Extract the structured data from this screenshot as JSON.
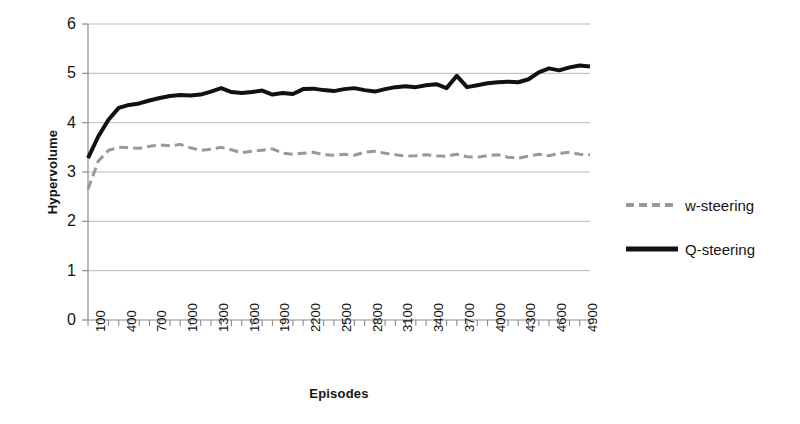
{
  "chart_data": {
    "type": "line",
    "title": "",
    "xlabel": "Episodes",
    "ylabel": "Hypervolume",
    "xlim": [
      100,
      5000
    ],
    "ylim": [
      0,
      6
    ],
    "grid": true,
    "legend_position": "right",
    "y_ticks": [
      0,
      1,
      2,
      3,
      4,
      5,
      6
    ],
    "x_tick_labels": [
      "100",
      "400",
      "700",
      "1000",
      "1300",
      "1600",
      "1900",
      "2200",
      "2500",
      "2800",
      "3100",
      "3400",
      "3700",
      "4000",
      "4300",
      "4600",
      "4900"
    ],
    "x_tick_values": [
      100,
      400,
      700,
      1000,
      1300,
      1600,
      1900,
      2200,
      2500,
      2800,
      3100,
      3400,
      3700,
      4000,
      4300,
      4600,
      4900
    ],
    "x_minor_step": 100,
    "x": [
      100,
      200,
      300,
      400,
      500,
      600,
      700,
      800,
      900,
      1000,
      1100,
      1200,
      1300,
      1400,
      1500,
      1600,
      1700,
      1800,
      1900,
      2000,
      2100,
      2200,
      2300,
      2400,
      2500,
      2600,
      2700,
      2800,
      2900,
      3000,
      3100,
      3200,
      3300,
      3400,
      3500,
      3600,
      3700,
      3800,
      3900,
      4000,
      4100,
      4200,
      4300,
      4400,
      4500,
      4600,
      4700,
      4800,
      4900,
      5000
    ],
    "series": [
      {
        "name": "w-steering",
        "color": "#999999",
        "style": "dashed",
        "width": 3,
        "values": [
          2.65,
          3.22,
          3.44,
          3.5,
          3.49,
          3.48,
          3.52,
          3.55,
          3.53,
          3.56,
          3.49,
          3.44,
          3.46,
          3.5,
          3.45,
          3.39,
          3.42,
          3.44,
          3.47,
          3.38,
          3.36,
          3.38,
          3.4,
          3.35,
          3.34,
          3.36,
          3.34,
          3.4,
          3.42,
          3.38,
          3.35,
          3.32,
          3.33,
          3.35,
          3.33,
          3.32,
          3.36,
          3.31,
          3.3,
          3.33,
          3.35,
          3.3,
          3.28,
          3.32,
          3.36,
          3.33,
          3.38,
          3.4,
          3.36,
          3.35
        ]
      },
      {
        "name": "Q-steering",
        "color": "#111111",
        "style": "solid",
        "width": 4,
        "values": [
          3.28,
          3.72,
          4.06,
          4.3,
          4.36,
          4.39,
          4.45,
          4.5,
          4.54,
          4.56,
          4.55,
          4.57,
          4.63,
          4.7,
          4.62,
          4.6,
          4.62,
          4.65,
          4.57,
          4.6,
          4.58,
          4.68,
          4.69,
          4.66,
          4.64,
          4.68,
          4.7,
          4.66,
          4.63,
          4.68,
          4.72,
          4.74,
          4.72,
          4.76,
          4.78,
          4.7,
          4.95,
          4.72,
          4.76,
          4.8,
          4.82,
          4.83,
          4.82,
          4.88,
          5.02,
          5.1,
          5.06,
          5.12,
          5.16,
          5.14
        ]
      }
    ]
  },
  "legend": {
    "items": [
      {
        "label": "w-steering"
      },
      {
        "label": "Q-steering"
      }
    ]
  }
}
